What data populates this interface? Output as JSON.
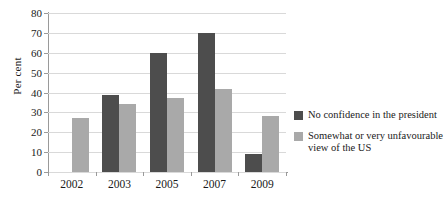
{
  "chart_data": {
    "type": "bar",
    "title": "",
    "subtitle": "",
    "xlabel": "",
    "ylabel": "Per cent",
    "ylim": [
      0,
      80
    ],
    "ytick_step": 10,
    "yticks": [
      80,
      70,
      60,
      50,
      40,
      30,
      20,
      10,
      0
    ],
    "grid": true,
    "legend_position": "right",
    "categories": [
      "2002",
      "2003",
      "2005",
      "2007",
      "2009"
    ],
    "series": [
      {
        "name": "No confidence in the president",
        "color": "#4d4d4d",
        "values": [
          null,
          39,
          60,
          70,
          9
        ]
      },
      {
        "name": "Somewhat or very unfavourable view of the US",
        "color": "#a9a9a9",
        "values": [
          27,
          34,
          37,
          42,
          28
        ]
      }
    ]
  },
  "legend": {
    "entries": [
      {
        "label": "No confidence in the president",
        "color": "#4d4d4d"
      },
      {
        "label": "Somewhat or very unfavourable view of the US",
        "color": "#a9a9a9"
      }
    ]
  }
}
